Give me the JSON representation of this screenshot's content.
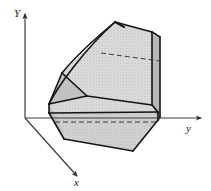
{
  "figure": {
    "background_color": "#ffffff",
    "width": 211,
    "height": 191
  },
  "axes": {
    "origin": {
      "x": 25,
      "y": 118
    },
    "line_color": "#3d3d3d",
    "items": [
      {
        "name": "vertical-axis",
        "label": "Y",
        "direction": "up",
        "label_x": 14,
        "label_y": 17,
        "from": {
          "x": 25,
          "y": 118
        },
        "to": {
          "x": 25,
          "y": 14
        }
      },
      {
        "name": "horizontal-axis",
        "label": "y",
        "direction": "right",
        "label_x": 186,
        "label_y": 132,
        "from": {
          "x": 25,
          "y": 118
        },
        "to": {
          "x": 201,
          "y": 118
        }
      },
      {
        "name": "depth-axis",
        "label": "x",
        "direction": "down-right",
        "label_x": 74,
        "label_y": 186,
        "from": {
          "x": 25,
          "y": 118
        },
        "to": {
          "x": 77,
          "y": 176
        }
      }
    ]
  },
  "solid": {
    "name": "curved-back-bracket",
    "outline_color": "#141414",
    "outline_width": 1.6,
    "interior_line_width": 1.0,
    "hidden_line_color": "#3a3a3a",
    "fill_light": "#dcdcdc",
    "fill_mid": "#d2d2d2",
    "fill_dark": "#c4c4c4",
    "fill_darkest": "#b9b9b9",
    "stipple_color": "#a8a8a8",
    "faces": [
      {
        "name": "base-front-face",
        "shade": "mid",
        "points": "49,113 64,139 133,151 158,120 158,112 49,104"
      },
      {
        "name": "base-top-face",
        "shade": "light",
        "points": "49,104 87,96 152,105 158,112 49,113"
      },
      {
        "name": "base-left-end-face",
        "shade": "dark",
        "points": "49,104 49,113 64,139 62,128"
      },
      {
        "name": "back-inner-face",
        "shade": "light",
        "points": "87,96 62,73 115,22 152,32 152,105"
      },
      {
        "name": "back-right-face",
        "shade": "darkest",
        "points": "152,32 160,37 160,117 158,120 152,105"
      },
      {
        "name": "left-fillet-face",
        "shade": "dark",
        "points": "49,104 62,73 87,96"
      },
      {
        "name": "top-face",
        "shade": "light",
        "points": "115,22 152,32 160,37 124,27"
      }
    ],
    "solid_edges": [
      "49,104 87,96",
      "87,96 152,105",
      "152,105 158,112",
      "158,112 49,113",
      "49,113 49,104",
      "49,113 64,139",
      "64,139 133,151",
      "133,151 158,120",
      "158,120 158,112",
      "87,96 62,73",
      "62,73 49,104",
      "115,22 152,32",
      "152,32 160,37",
      "160,37 160,117",
      "160,117 158,120",
      "152,32 152,105",
      "115,22 124,27"
    ],
    "curved_edges": [
      {
        "name": "back-outer-silhouette",
        "d": "M 49,104 C 58,86 84,50 115,22"
      },
      {
        "name": "back-inner-silhouette",
        "d": "M 62,73 C 76,56 98,36 115,22"
      },
      {
        "name": "back-top-outer",
        "d": "M 124,27 C 119,24 117,23 115,22"
      }
    ],
    "hidden_edges": [
      {
        "name": "upper-hidden-edge",
        "from": {
          "x": 101,
          "y": 53
        },
        "to": {
          "x": 160,
          "y": 61
        }
      },
      {
        "name": "lower-hidden-edge",
        "from": {
          "x": 55,
          "y": 122
        },
        "to": {
          "x": 158,
          "y": 122
        }
      }
    ]
  }
}
